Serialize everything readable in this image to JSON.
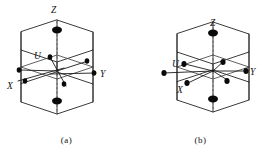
{
  "figure": {
    "panels": [
      {
        "id": "a",
        "caption": "(a)",
        "shape": "hexagonal-prism",
        "axis_labels": [
          {
            "name": "Z",
            "text": "Z",
            "x": 51,
            "y": 11
          },
          {
            "name": "U",
            "text": "U",
            "x": 35,
            "y": 56
          },
          {
            "name": "Y",
            "text": "Y",
            "x": 101,
            "y": 74
          },
          {
            "name": "X",
            "text": "X",
            "x": 9,
            "y": 86
          }
        ],
        "atoms": [
          {
            "name": "top-face-center-atom",
            "cx": 57,
            "cy": 30,
            "rx": 5.0,
            "ry": 3.4
          },
          {
            "name": "bottom-face-center-atom",
            "cx": 57,
            "cy": 101,
            "rx": 5.0,
            "ry": 3.4
          },
          {
            "name": "center-atom",
            "cx": 57,
            "cy": 71,
            "rx": 2.2,
            "ry": 2.6
          },
          {
            "name": "u-axis-atom",
            "cx": 50,
            "cy": 57,
            "rx": 2.3,
            "ry": 2.8
          },
          {
            "name": "right-upper-atom",
            "cx": 87,
            "cy": 61,
            "rx": 2.3,
            "ry": 2.8
          },
          {
            "name": "y-axis-atom",
            "cx": 94,
            "cy": 73,
            "rx": 2.3,
            "ry": 2.8
          },
          {
            "name": "left-upper-atom",
            "cx": 19,
            "cy": 70,
            "rx": 2.3,
            "ry": 2.8
          },
          {
            "name": "x-axis-atom",
            "cx": 25,
            "cy": 81,
            "rx": 2.3,
            "ry": 2.8
          },
          {
            "name": "lower-center-atom",
            "cx": 64,
            "cy": 84,
            "rx": 2.3,
            "ry": 2.8
          }
        ]
      },
      {
        "id": "b",
        "caption": "(b)",
        "shape": "hexagonal-prism",
        "axis_labels": [
          {
            "name": "Z",
            "text": "Z",
            "x": 78,
            "y": 23
          },
          {
            "name": "U",
            "text": "U",
            "x": 39,
            "y": 65
          },
          {
            "name": "Y",
            "text": "Y",
            "x": 117,
            "y": 73
          },
          {
            "name": "X",
            "text": "X",
            "x": 44,
            "y": 92
          }
        ],
        "atoms": [
          {
            "name": "top-face-center-atom",
            "cx": 79,
            "cy": 33,
            "rx": 5.0,
            "ry": 3.4
          },
          {
            "name": "bottom-face-center-atom",
            "cx": 79,
            "cy": 99,
            "rx": 5.0,
            "ry": 3.4
          },
          {
            "name": "u-axis-atom",
            "cx": 50,
            "cy": 64,
            "rx": 2.6,
            "ry": 3.0
          },
          {
            "name": "upper-right-atom",
            "cx": 89,
            "cy": 62,
            "rx": 2.6,
            "ry": 3.0
          },
          {
            "name": "y-axis-atom",
            "cx": 112,
            "cy": 71,
            "rx": 2.6,
            "ry": 3.0
          },
          {
            "name": "left-mid-atom",
            "cx": 30,
            "cy": 73,
            "rx": 2.6,
            "ry": 3.0
          },
          {
            "name": "x-axis-atom",
            "cx": 53,
            "cy": 83,
            "rx": 2.6,
            "ry": 3.0
          },
          {
            "name": "lower-right-atom",
            "cx": 93,
            "cy": 81,
            "rx": 2.6,
            "ry": 3.0
          }
        ]
      }
    ],
    "colors": {
      "background": "#ffffff",
      "edge": "#262626",
      "atom": "#0a0a0a",
      "axis": "#1a1a1a",
      "dashed_axis": "#555555",
      "label": "#111111"
    }
  }
}
